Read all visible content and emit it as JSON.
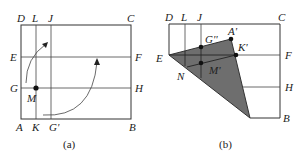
{
  "figure": {
    "panel_a": {
      "caption": "(a)",
      "labels": {
        "D": "D",
        "L": "L",
        "J": "J",
        "C": "C",
        "E": "E",
        "F": "F",
        "G": "G",
        "H": "H",
        "M": "M",
        "A": "A",
        "K": "K",
        "G_prime": "G'",
        "B": "B"
      }
    },
    "panel_b": {
      "caption": "(b)",
      "labels": {
        "D": "D",
        "L": "L",
        "J": "J",
        "C": "C",
        "E": "E",
        "F": "F",
        "H": "H",
        "B": "B",
        "N": "N",
        "G_dprime": "G''",
        "A_prime": "A'",
        "K_prime": "K'",
        "M_prime": "M'"
      },
      "shade_color": "#6e6e6e"
    }
  }
}
